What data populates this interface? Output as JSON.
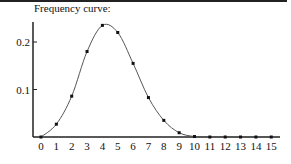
{
  "chart_data": {
    "type": "line",
    "title": "Frequency curve:",
    "xlabel": "",
    "ylabel": "",
    "x": [
      0,
      1,
      2,
      3,
      4,
      5,
      6,
      7,
      8,
      9,
      10,
      11,
      12,
      13,
      14,
      15
    ],
    "series": [
      {
        "name": "frequency",
        "values": [
          0.0,
          0.027,
          0.086,
          0.18,
          0.235,
          0.22,
          0.155,
          0.083,
          0.035,
          0.009,
          0.001,
          0.0,
          0.0,
          0.0,
          0.0,
          0.0
        ]
      }
    ],
    "x_tick_labels": [
      "0",
      "1",
      "2",
      "3",
      "4",
      "5",
      "6",
      "7",
      "8",
      "9",
      "10",
      "11",
      "12",
      "13",
      "14",
      "15"
    ],
    "y_ticks": [
      0.1,
      0.2
    ],
    "y_tick_labels": [
      "0.1",
      "0.2"
    ],
    "xlim": [
      0,
      15
    ],
    "ylim": [
      0,
      0.25
    ],
    "grid": false,
    "legend": null,
    "markers": true,
    "smooth_curve": true
  },
  "colors": {
    "curve": "#555555",
    "markers": "#111111",
    "axes": "#222222"
  }
}
